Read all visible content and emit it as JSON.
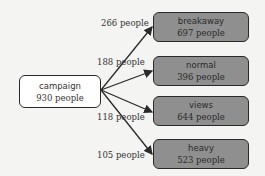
{
  "diagram": {
    "type": "flow",
    "source": {
      "name": "campaign",
      "count": "930 people"
    },
    "targets": [
      {
        "name": "breakaway",
        "count": "697 people",
        "edge_label": "266 people"
      },
      {
        "name": "normal",
        "count": "396 people",
        "edge_label": "188 people"
      },
      {
        "name": "views",
        "count": "644 people",
        "edge_label": "118 people"
      },
      {
        "name": "heavy",
        "count": "523 people",
        "edge_label": "105 people"
      }
    ]
  },
  "colors": {
    "background": "#f4f4f2",
    "source_fill": "#ffffff",
    "target_fill": "#8f8f8f",
    "border": "#2a2a2a",
    "arrow": "#2a2a2a"
  }
}
